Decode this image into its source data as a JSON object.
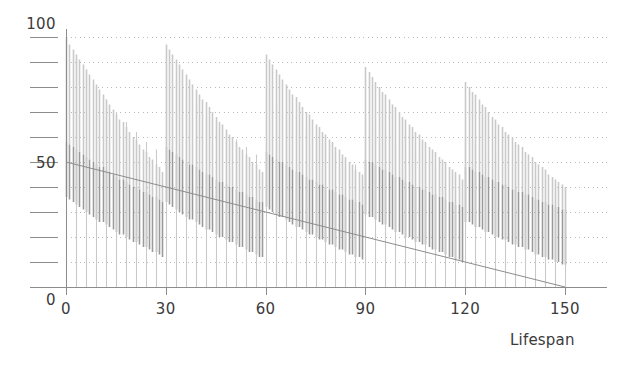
{
  "chart_data": {
    "type": "bar",
    "title": "",
    "subtitle": "",
    "xlabel": "Lifespan",
    "ylabel": "",
    "xlim": [
      0,
      150
    ],
    "ylim": [
      0,
      100
    ],
    "grid": true,
    "grid_orientation": "horizontal",
    "grid_style": "dotted",
    "grid_step": 10,
    "legend": "none",
    "colors": {
      "bar_dark": "#9a9a9a",
      "bar_light": "#c9c9c9",
      "axis": "#8c8c8c",
      "grid": "#b9b9b9",
      "trend_line": "#8c8c8c",
      "text": "#3b3b3b",
      "background": "#ffffff"
    },
    "axes": {
      "x": {
        "ticks": [
          0,
          30,
          60,
          90,
          120,
          150
        ],
        "tick_labels": [
          "0",
          "30",
          "60",
          "90",
          "120",
          "150"
        ],
        "minor_tick_step": 30
      },
      "y": {
        "ticks": [
          0,
          10,
          20,
          30,
          40,
          50,
          60,
          70,
          80,
          90,
          100
        ],
        "labeled_ticks": [
          0,
          50,
          100
        ],
        "tick_labels": [
          "0",
          "50",
          "100"
        ]
      }
    },
    "trend_line": {
      "name": "regression line",
      "x": [
        0,
        150
      ],
      "y": [
        50,
        0
      ]
    },
    "series": [
      {
        "name": "lifespan bars",
        "description": "vertical bars drawn from baseline 0 up to value; arranged in descending cascade groups restarting near x = 0, 30, 60, 90, 120",
        "x": [
          0,
          1,
          2,
          3,
          4,
          5,
          6,
          7,
          8,
          9,
          10,
          11,
          12,
          13,
          14,
          15,
          16,
          17,
          18,
          19,
          20,
          21,
          22,
          23,
          24,
          25,
          26,
          27,
          28,
          29,
          30,
          31,
          32,
          33,
          34,
          35,
          36,
          37,
          38,
          39,
          40,
          41,
          42,
          43,
          44,
          45,
          46,
          47,
          48,
          49,
          50,
          51,
          52,
          53,
          54,
          55,
          56,
          57,
          58,
          59,
          60,
          61,
          62,
          63,
          64,
          65,
          66,
          67,
          68,
          69,
          70,
          71,
          72,
          73,
          74,
          75,
          76,
          77,
          78,
          79,
          80,
          81,
          82,
          83,
          84,
          85,
          86,
          87,
          88,
          89,
          90,
          91,
          92,
          93,
          94,
          95,
          96,
          97,
          98,
          99,
          100,
          101,
          102,
          103,
          104,
          105,
          106,
          107,
          108,
          109,
          110,
          111,
          112,
          113,
          114,
          115,
          116,
          117,
          118,
          119,
          120,
          121,
          122,
          123,
          124,
          125,
          126,
          127,
          128,
          129,
          130,
          131,
          132,
          133,
          134,
          135,
          136,
          137,
          138,
          139,
          140,
          141,
          142,
          143,
          144,
          145,
          146,
          147,
          148,
          149,
          150
        ],
        "values": [
          100,
          97,
          95,
          93,
          91,
          89,
          87,
          85,
          83,
          81,
          79,
          77,
          75,
          73,
          71,
          69,
          67,
          66,
          64,
          62,
          60,
          59,
          57,
          55,
          54,
          52,
          51,
          49,
          48,
          46,
          97,
          95,
          93,
          91,
          89,
          87,
          85,
          83,
          81,
          79,
          77,
          75,
          74,
          72,
          70,
          68,
          66,
          65,
          63,
          61,
          60,
          58,
          56,
          55,
          53,
          52,
          50,
          49,
          47,
          46,
          93,
          91,
          89,
          87,
          85,
          83,
          81,
          79,
          77,
          76,
          74,
          72,
          70,
          69,
          67,
          65,
          64,
          62,
          61,
          59,
          58,
          56,
          55,
          53,
          52,
          50,
          49,
          47,
          46,
          45,
          88,
          86,
          84,
          82,
          80,
          78,
          77,
          75,
          73,
          72,
          70,
          68,
          67,
          65,
          64,
          62,
          61,
          59,
          58,
          56,
          55,
          54,
          52,
          51,
          50,
          48,
          47,
          46,
          45,
          43,
          82,
          80,
          78,
          77,
          75,
          73,
          72,
          70,
          68,
          67,
          65,
          64,
          62,
          61,
          60,
          58,
          57,
          56,
          54,
          53,
          52,
          50,
          49,
          48,
          47,
          45,
          44,
          43,
          42,
          41,
          40
        ],
        "lower_values": [
          58,
          57,
          56,
          55,
          54,
          53,
          52,
          51,
          50,
          49,
          48,
          48,
          47,
          46,
          45,
          44,
          43,
          43,
          42,
          41,
          40,
          40,
          39,
          38,
          38,
          37,
          36,
          36,
          35,
          34,
          56,
          55,
          54,
          53,
          52,
          51,
          50,
          49,
          49,
          48,
          47,
          46,
          45,
          45,
          44,
          43,
          42,
          42,
          41,
          40,
          40,
          39,
          38,
          38,
          37,
          36,
          36,
          35,
          34,
          34,
          54,
          53,
          52,
          51,
          50,
          50,
          49,
          48,
          47,
          46,
          46,
          45,
          44,
          43,
          43,
          42,
          41,
          41,
          40,
          39,
          39,
          38,
          37,
          37,
          36,
          35,
          35,
          34,
          34,
          33,
          51,
          50,
          50,
          49,
          48,
          47,
          47,
          46,
          45,
          44,
          44,
          43,
          42,
          42,
          41,
          40,
          40,
          39,
          39,
          38,
          37,
          37,
          36,
          36,
          35,
          34,
          34,
          33,
          33,
          32,
          48,
          48,
          47,
          46,
          46,
          45,
          44,
          44,
          43,
          42,
          42,
          41,
          41,
          40,
          39,
          39,
          38,
          38,
          37,
          37,
          36,
          35,
          35,
          34,
          34,
          33,
          33,
          32,
          32,
          31,
          31
        ]
      },
      {
        "name": "baseline spikes",
        "description": "sparse taller light bars marking group baselines, rising from 0",
        "x": [
          0,
          3,
          6,
          9,
          12,
          15,
          18,
          21,
          24,
          27,
          30,
          33,
          36,
          39,
          42,
          45,
          48,
          51,
          54,
          57,
          60,
          63,
          66,
          69,
          72,
          75,
          78,
          81,
          84,
          87,
          90,
          93,
          96,
          99,
          102,
          105,
          108,
          111,
          114,
          117,
          120,
          123,
          126,
          129,
          132,
          135,
          138,
          141,
          144,
          147,
          150
        ],
        "values": [
          100,
          92,
          86,
          80,
          75,
          70,
          66,
          62,
          58,
          55,
          88,
          83,
          78,
          74,
          70,
          66,
          62,
          59,
          56,
          53,
          77,
          73,
          69,
          66,
          63,
          60,
          57,
          54,
          51,
          49,
          68,
          65,
          62,
          59,
          56,
          54,
          51,
          49,
          47,
          45,
          59,
          57,
          55,
          53,
          51,
          49,
          47,
          45,
          43,
          41,
          40
        ]
      }
    ]
  },
  "axis_labels": {
    "x_label": "Lifespan"
  }
}
